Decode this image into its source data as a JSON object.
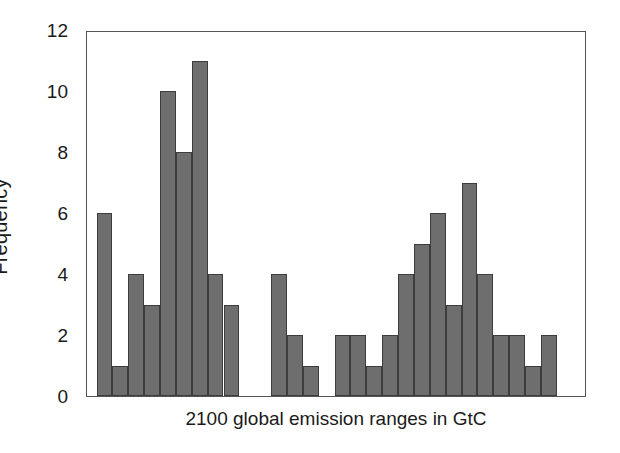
{
  "chart_data": {
    "type": "bar",
    "title": "",
    "subtitle": "",
    "xlabel": "2100 global emission ranges in GtC",
    "ylabel": "Frequency",
    "ylim": [
      0,
      12
    ],
    "yticks": [
      0,
      2,
      4,
      6,
      8,
      10,
      12
    ],
    "ytick_labels": [
      "0",
      "2",
      "4",
      "6",
      "8",
      "10",
      "12"
    ],
    "xticks": [],
    "xtick_labels": [],
    "grid": false,
    "legend": null,
    "bar_color": "#6e6e6e",
    "bar_edge_color": "#3d3d3d",
    "axis_color": "#555555",
    "background_color": "#ffffff",
    "n_bins": 25,
    "bin_slots": 30,
    "categories": [
      "b1",
      "b2",
      "b3",
      "b4",
      "b5",
      "b6",
      "b7",
      "b8",
      "b9",
      "gap1",
      "gap2",
      "b10",
      "b11",
      "b12",
      "gap3",
      "b13",
      "b14",
      "b15",
      "b16",
      "b17",
      "b18",
      "b19",
      "b20",
      "b21",
      "b22",
      "b23",
      "b24",
      "b25",
      "b26",
      "b27"
    ],
    "values": [
      6,
      1,
      4,
      3,
      10,
      8,
      11,
      4,
      3,
      0,
      0,
      4,
      2,
      1,
      0,
      2,
      2,
      1,
      2,
      4,
      5,
      6,
      3,
      7,
      4,
      2,
      2,
      1,
      2,
      0
    ],
    "groups": [
      {
        "name": "left-cluster",
        "values": [
          6,
          1,
          4,
          3,
          10,
          8,
          11,
          4,
          3
        ]
      },
      {
        "name": "middle-cluster",
        "values": [
          4,
          2,
          1
        ]
      },
      {
        "name": "right-cluster",
        "values": [
          2,
          2,
          1,
          2,
          4,
          5,
          6,
          3,
          7,
          4,
          2,
          2,
          1,
          2
        ]
      }
    ],
    "total_frequency": 86
  },
  "axis": {
    "ylabel": "Frequency",
    "xlabel": "2100 global emission ranges in GtC"
  }
}
